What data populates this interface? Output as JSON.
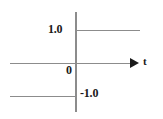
{
  "figure": {
    "title": "",
    "background_color": "#ffffff",
    "axis_color": "#8c8c8c",
    "text_color": "#1a1a1a"
  },
  "labels": {
    "upper_level": "1.0",
    "origin": "0",
    "lower_level": "-1.0",
    "horizontal_axis": "t"
  },
  "icons": {
    "axis_arrow": "arrow-right-icon"
  },
  "chart_data": {
    "type": "line",
    "title": "",
    "xlabel": "t",
    "ylabel": "",
    "grid": false,
    "legend": null,
    "xlim": [
      -1.1,
      1.15
    ],
    "ylim": [
      -1.45,
      1.45
    ],
    "yticks": [
      1.0,
      0,
      -1.0
    ],
    "ytick_labels": [
      "1.0",
      "0",
      "-1.0"
    ],
    "xticks": [],
    "xtick_labels": [],
    "annotations": [
      {
        "text": "1.0",
        "x": -0.23,
        "y": 1.0,
        "bold": true
      },
      {
        "text": "0",
        "x": -0.09,
        "y": -0.12,
        "bold": true
      },
      {
        "text": "-1.0",
        "x": 0.09,
        "y": -1.0,
        "bold": true
      },
      {
        "text": "t",
        "x": 1.12,
        "y": 0.1,
        "bold": true
      }
    ],
    "series": [
      {
        "name": "signum",
        "values": [
          {
            "x": -1.0,
            "y": -1.0
          },
          {
            "x": 0.0,
            "y": -1.0
          },
          {
            "x": 0.0,
            "y": 1.0
          },
          {
            "x": 1.0,
            "y": 1.0
          }
        ],
        "description": "step from -1.0 for t<0 to 1.0 for t>0"
      }
    ],
    "axes": [
      {
        "name": "horizontal-time-axis",
        "from": {
          "x": -1.0,
          "y": 0
        },
        "to": {
          "x": 1.0,
          "y": 0
        },
        "arrow": "right",
        "label": "t"
      },
      {
        "name": "vertical-value-axis",
        "from": {
          "x": 0,
          "y": -1.45
        },
        "to": {
          "x": 0,
          "y": 1.45
        },
        "arrow": "none",
        "label": ""
      }
    ]
  }
}
